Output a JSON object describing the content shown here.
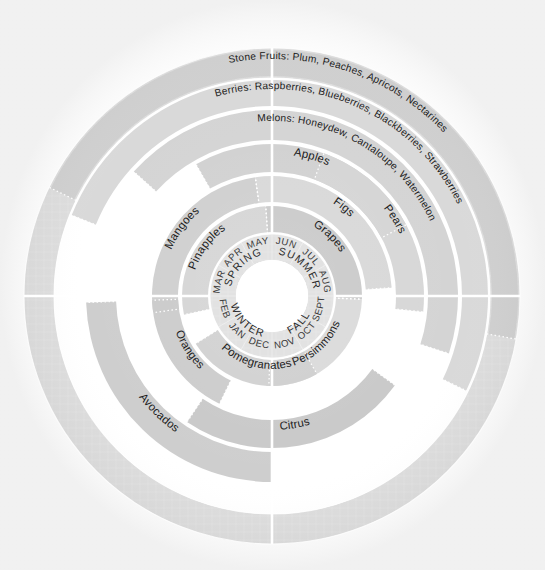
{
  "chart_data": {
    "type": "pie",
    "legend_position": "none",
    "grid": false,
    "center_hub": {
      "fill": "#ffffff"
    },
    "seasons": [
      {
        "label": "SPRING",
        "start_month": "MAR",
        "months": [
          "MAR",
          "APR",
          "MAY"
        ],
        "start_deg": 270,
        "end_deg": 360
      },
      {
        "label": "SUMMER",
        "start_month": "JUN",
        "months": [
          "JUN",
          "JUL",
          "AUG"
        ],
        "start_deg": 0,
        "end_deg": 90
      },
      {
        "label": "FALL",
        "start_month": "SEPT",
        "months": [
          "SEPT",
          "OCT",
          "NOV"
        ],
        "start_deg": 90,
        "end_deg": 180
      },
      {
        "label": "WINTER",
        "start_month": "DEC",
        "months": [
          "DEC",
          "JAN",
          "FEB"
        ],
        "start_deg": 180,
        "end_deg": 270
      }
    ],
    "months": [
      "JAN",
      "FEB",
      "MAR",
      "APR",
      "MAY",
      "JUN",
      "JUL",
      "AUG",
      "SEPT",
      "OCT",
      "NOV",
      "DEC"
    ],
    "month_start_deg": 210,
    "rings": [
      {
        "index": 0,
        "r_inner": 62,
        "r_outer": 92,
        "items": [
          {
            "label": "Pinapples",
            "start_deg": 258,
            "end_deg": 356,
            "fill": "#d3d3d3"
          },
          {
            "label": "Grapes",
            "start_deg": 356,
            "end_deg": 92,
            "fill": "#c7c7c7"
          },
          {
            "label": "Persimmons",
            "start_deg": 92,
            "end_deg": 182,
            "fill": "#d8d8d8"
          },
          {
            "label": "Pomegranates",
            "start_deg": 150,
            "end_deg": 238,
            "fill": "#cfcfcf"
          }
        ]
      },
      {
        "index": 1,
        "r_inner": 92,
        "r_outer": 122,
        "items": [
          {
            "label": "Mangoes",
            "start_deg": 262,
            "end_deg": 352,
            "fill": "#cccccc"
          },
          {
            "label": "Figs",
            "start_deg": 352,
            "end_deg": 86,
            "fill": "#d6d6d6"
          },
          {
            "label": "Oranges",
            "start_deg": 206,
            "end_deg": 268,
            "fill": "#c9c9c9"
          }
        ]
      },
      {
        "index": 2,
        "r_inner": 122,
        "r_outer": 154,
        "items": [
          {
            "label": "Apples",
            "start_deg": 330,
            "end_deg": 62,
            "fill": "#cfcfcf"
          },
          {
            "label": "Pears",
            "start_deg": 20,
            "end_deg": 96,
            "fill": "#d5d5d5"
          },
          {
            "label": "Citrus",
            "start_deg": 126,
            "end_deg": 214,
            "fill": "#c6c6c6"
          }
        ]
      },
      {
        "index": 3,
        "r_inner": 154,
        "r_outer": 188,
        "items": [
          {
            "label": "Melons: Honeydew, Cantaloupe, Watermelon",
            "start_deg": 312,
            "end_deg": 108,
            "fill": "#d2d2d2"
          },
          {
            "label": "Avocados",
            "start_deg": 180,
            "end_deg": 268,
            "fill": "#cbcbcb"
          }
        ]
      },
      {
        "index": 4,
        "r_inner": 188,
        "r_outer": 218,
        "items": [
          {
            "label": "Berries: Raspberries, Blueberries, Blackberries, Strawberries",
            "start_deg": 292,
            "end_deg": 116,
            "fill": "#d7d7d7"
          }
        ]
      },
      {
        "index": 5,
        "r_inner": 218,
        "r_outer": 248,
        "items": [
          {
            "label": "Stone Fruits: Plum, Peaches, Apricots, Nectarines",
            "start_deg": 296,
            "end_deg": 100,
            "fill": "#cdcdcd"
          }
        ]
      }
    ],
    "colors": {
      "background": "#ffffff",
      "ring_light": "#dcdcdc",
      "ring_mid": "#cfcfcf",
      "ring_dark": "#c3c3c3",
      "divider": "#ffffff",
      "text": "#1c1c1c"
    },
    "geometry": {
      "center_x": 272,
      "center_y": 296,
      "outer_radius": 248,
      "hub_radius": 36
    }
  },
  "labels": {
    "stone_fruits": "Stone Fruits: Plum, Peaches, Apricots, Nectarines",
    "berries": "Berries: Raspberries, Blueberries, Blackberries, Strawberries",
    "melons": "Melons: Honeydew, Cantaloupe, Watermelon",
    "avocados": "Avocados",
    "citrus": "Citrus",
    "apples": "Apples",
    "pears": "Pears",
    "oranges": "Oranges",
    "mangoes": "Mangoes",
    "figs": "Figs",
    "pinapples": "Pinapples",
    "grapes": "Grapes",
    "persimmons": "Persimmons",
    "pomegranates": "Pomegranates"
  },
  "seasons": {
    "spring": "SPRING",
    "summer": "SUMMER",
    "fall": "FALL",
    "winter": "WINTER"
  },
  "months": {
    "jan": "JAN",
    "feb": "FEB",
    "mar": "MAR",
    "apr": "APR",
    "may": "MAY",
    "jun": "JUN",
    "jul": "JUL",
    "aug": "AUG",
    "sept": "SEPT",
    "oct": "OCT",
    "nov": "NOV",
    "dec": "DEC"
  }
}
